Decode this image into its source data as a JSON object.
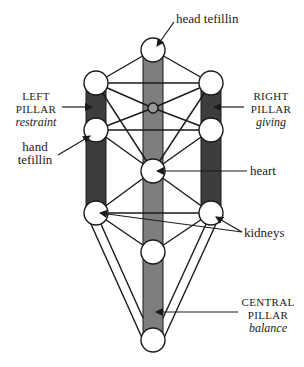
{
  "diagram": {
    "type": "tree-of-life",
    "colors": {
      "side_pillar": "#3d3d3d",
      "central_pillar": "#7e7e7e",
      "line": "#1a1a1a",
      "node_fill": "#ffffff"
    },
    "labels": {
      "head_tefillin": "head tefillin",
      "left_pillar": {
        "title_1": "LEFT",
        "title_2": "PILLAR",
        "subtitle": "restraint"
      },
      "right_pillar": {
        "title_1": "RIGHT",
        "title_2": "PILLAR",
        "subtitle": "giving"
      },
      "hand_tefillin": {
        "line_1": "hand",
        "line_2": "tefillin"
      },
      "heart": "heart",
      "kidneys": "kidneys",
      "central_pillar": {
        "title_1": "CENTRAL",
        "title_2": "PILLAR",
        "subtitle": "balance"
      }
    }
  }
}
